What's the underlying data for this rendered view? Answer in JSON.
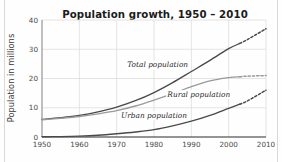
{
  "chart_data": {
    "type": "line",
    "title": "Population growth, 1950 – 2010",
    "xlabel": "",
    "ylabel": "Population in millions",
    "xlim": [
      1950,
      2010
    ],
    "ylim": [
      0,
      40
    ],
    "x_ticks": [
      "1950",
      "1960",
      "1970",
      "1980",
      "1990",
      "2000",
      "2010"
    ],
    "y_ticks": [
      "0",
      "10",
      "20",
      "30",
      "40"
    ],
    "grid": true,
    "legend_position": "inline-labels",
    "projection_note": "dashed segments from 2003 onward are projections",
    "x": [
      1950,
      1955,
      1960,
      1965,
      1970,
      1975,
      1980,
      1985,
      1990,
      1995,
      2000,
      2003
    ],
    "series": [
      {
        "name": "Total population",
        "color": "#4a4a4a",
        "values": [
          6.0,
          6.6,
          7.4,
          8.6,
          10.2,
          12.4,
          15.2,
          18.6,
          22.4,
          26.2,
          30.2,
          32.0
        ],
        "projection_x": [
          2003,
          2005,
          2010
        ],
        "projection_values": [
          32.0,
          33.3,
          37.0
        ]
      },
      {
        "name": "Rural population",
        "color": "#9a9a9a",
        "values": [
          5.9,
          6.4,
          7.0,
          7.9,
          9.0,
          10.6,
          12.6,
          14.8,
          17.2,
          19.2,
          20.3,
          20.6
        ],
        "projection_x": [
          2003,
          2005,
          2010
        ],
        "projection_values": [
          20.6,
          20.8,
          21.0
        ]
      },
      {
        "name": "Urban population",
        "color": "#4a4a4a",
        "values": [
          0.1,
          0.15,
          0.3,
          0.6,
          1.1,
          1.7,
          2.5,
          3.8,
          5.4,
          7.4,
          9.8,
          11.2
        ],
        "projection_x": [
          2003,
          2005,
          2010
        ],
        "projection_values": [
          11.2,
          12.3,
          16.0
        ]
      }
    ],
    "inline_labels": [
      {
        "text": "Total population",
        "x": 1981,
        "y": 23.8
      },
      {
        "text": "Rural population",
        "x": 1992,
        "y": 13.8
      },
      {
        "text": "Urban population",
        "x": 1980,
        "y": 6.6
      }
    ]
  }
}
